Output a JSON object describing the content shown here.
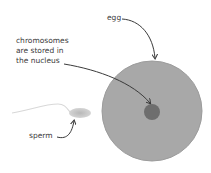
{
  "diagram": {
    "labels": {
      "egg": "egg",
      "chromosomes_line1": "chromosomes",
      "chromosomes_line2": "are stored in",
      "chromosomes_line3": "the nucleus",
      "sperm": "sperm"
    },
    "colors": {
      "egg_fill": "#a8a8a8",
      "egg_edge": "#9c9c9c",
      "nucleus_fill": "#6e6e6e",
      "sperm_head": "#c4c4c4",
      "sperm_tail": "#d8d8d8",
      "arrow": "#3a3a3a",
      "text": "#3a3a3a"
    }
  }
}
